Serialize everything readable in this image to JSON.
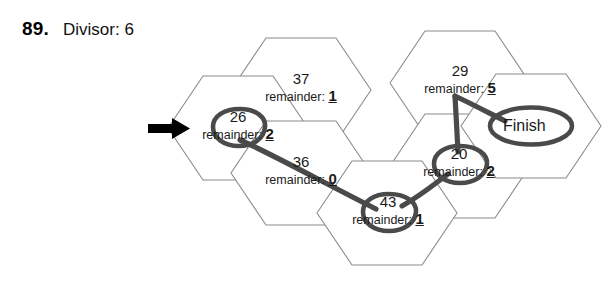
{
  "problem": {
    "number": "89.",
    "title": "Divisor: 6"
  },
  "colors": {
    "hex_stroke": "#8a8a8a",
    "ink": "#3a3a3a",
    "text": "#1a1a1a",
    "background": "#ffffff"
  },
  "start_arrow": {
    "name": "start-arrow",
    "points_to": "26"
  },
  "cells": [
    {
      "id": "cell-37",
      "value": "37",
      "remainder_label": "remainder:",
      "remainder": "1",
      "circled": false,
      "cx": 301,
      "cy": 90
    },
    {
      "id": "cell-26",
      "value": "26",
      "remainder_label": "remainder:",
      "remainder": "2",
      "circled": true,
      "cx": 238,
      "cy": 128
    },
    {
      "id": "cell-36",
      "value": "36",
      "remainder_label": "remainder:",
      "remainder": "0",
      "circled": false,
      "cx": 301,
      "cy": 173
    },
    {
      "id": "cell-43",
      "value": "43",
      "remainder_label": "remainder:",
      "remainder": "1",
      "circled": true,
      "cx": 388,
      "cy": 213
    },
    {
      "id": "cell-20",
      "value": "20",
      "remainder_label": "remainder:",
      "remainder": "2",
      "circled": true,
      "cx": 459,
      "cy": 165
    },
    {
      "id": "cell-29",
      "value": "29",
      "remainder_label": "remainder:",
      "remainder": "5",
      "circled": false,
      "cx": 460,
      "cy": 82
    },
    {
      "id": "cell-finish",
      "value": "Finish",
      "remainder_label": "",
      "remainder": "",
      "circled": true,
      "cx": 531,
      "cy": 126
    }
  ],
  "path": {
    "name": "solution-path",
    "order": [
      "26",
      "43",
      "20",
      "29",
      "Finish"
    ]
  }
}
